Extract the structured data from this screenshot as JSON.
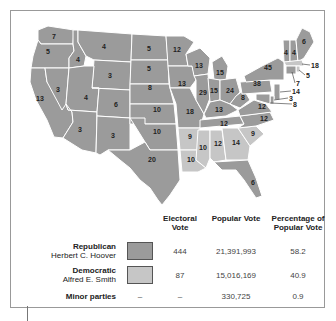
{
  "colors": {
    "republican": "#9b9b9b",
    "democratic": "#c6c6c6",
    "border": "#ffffff"
  },
  "states": [
    {
      "abbr": "WA",
      "ev": "7",
      "party": "R"
    },
    {
      "abbr": "OR",
      "ev": "5",
      "party": "R"
    },
    {
      "abbr": "CA",
      "ev": "13",
      "party": "R"
    },
    {
      "abbr": "NV",
      "ev": "3",
      "party": "R"
    },
    {
      "abbr": "ID",
      "ev": "4",
      "party": "R"
    },
    {
      "abbr": "MT",
      "ev": "4",
      "party": "R"
    },
    {
      "abbr": "WY",
      "ev": "3",
      "party": "R"
    },
    {
      "abbr": "UT",
      "ev": "4",
      "party": "R"
    },
    {
      "abbr": "AZ",
      "ev": "3",
      "party": "R"
    },
    {
      "abbr": "CO",
      "ev": "6",
      "party": "R"
    },
    {
      "abbr": "NM",
      "ev": "3",
      "party": "R"
    },
    {
      "abbr": "ND",
      "ev": "5",
      "party": "R"
    },
    {
      "abbr": "SD",
      "ev": "5",
      "party": "R"
    },
    {
      "abbr": "NE",
      "ev": "8",
      "party": "R"
    },
    {
      "abbr": "KS",
      "ev": "10",
      "party": "R"
    },
    {
      "abbr": "OK",
      "ev": "10",
      "party": "R"
    },
    {
      "abbr": "TX",
      "ev": "20",
      "party": "R"
    },
    {
      "abbr": "MN",
      "ev": "12",
      "party": "R"
    },
    {
      "abbr": "IA",
      "ev": "13",
      "party": "R"
    },
    {
      "abbr": "MO",
      "ev": "18",
      "party": "R"
    },
    {
      "abbr": "AR",
      "ev": "9",
      "party": "D"
    },
    {
      "abbr": "LA",
      "ev": "10",
      "party": "D"
    },
    {
      "abbr": "WI",
      "ev": "13",
      "party": "R"
    },
    {
      "abbr": "IL",
      "ev": "29",
      "party": "R"
    },
    {
      "abbr": "MI",
      "ev": "15",
      "party": "R"
    },
    {
      "abbr": "IN",
      "ev": "15",
      "party": "R"
    },
    {
      "abbr": "OH",
      "ev": "24",
      "party": "R"
    },
    {
      "abbr": "KY",
      "ev": "13",
      "party": "R"
    },
    {
      "abbr": "TN",
      "ev": "12",
      "party": "R"
    },
    {
      "abbr": "MS",
      "ev": "10",
      "party": "D"
    },
    {
      "abbr": "AL",
      "ev": "12",
      "party": "D"
    },
    {
      "abbr": "GA",
      "ev": "14",
      "party": "D"
    },
    {
      "abbr": "FL",
      "ev": "6",
      "party": "R"
    },
    {
      "abbr": "SC",
      "ev": "9",
      "party": "D"
    },
    {
      "abbr": "NC",
      "ev": "12",
      "party": "R"
    },
    {
      "abbr": "VA",
      "ev": "12",
      "party": "R"
    },
    {
      "abbr": "WV",
      "ev": "8",
      "party": "R"
    },
    {
      "abbr": "PA",
      "ev": "38",
      "party": "R"
    },
    {
      "abbr": "NY",
      "ev": "45",
      "party": "R"
    },
    {
      "abbr": "VT",
      "ev": "4",
      "party": "R"
    },
    {
      "abbr": "NH",
      "ev": "4",
      "party": "R"
    },
    {
      "abbr": "ME",
      "ev": "6",
      "party": "R"
    },
    {
      "abbr": "MA",
      "ev": "18",
      "party": "D"
    },
    {
      "abbr": "RI",
      "ev": "5",
      "party": "D"
    },
    {
      "abbr": "CT",
      "ev": "7",
      "party": "R"
    },
    {
      "abbr": "NJ",
      "ev": "14",
      "party": "R"
    },
    {
      "abbr": "DE",
      "ev": "3",
      "party": "R"
    },
    {
      "abbr": "MD",
      "ev": "8",
      "party": "R"
    }
  ],
  "table": {
    "headers": {
      "electoral": "Electoral Vote",
      "popular": "Popular Vote",
      "percentage": "Percentage of Popular Vote"
    },
    "rows": [
      {
        "party": "Republican",
        "candidate": "Herbert C. Hoover",
        "swatch": "republican",
        "electoral": "444",
        "popular": "21,391,993",
        "percentage": "58.2"
      },
      {
        "party": "Democratic",
        "candidate": "Alfred E. Smith",
        "swatch": "democratic",
        "electoral": "87",
        "popular": "15,016,169",
        "percentage": "40.9"
      },
      {
        "party": "Minor parties",
        "candidate": "",
        "swatch": "",
        "swatch_placeholder": "–",
        "electoral": "–",
        "popular": "330,725",
        "percentage": "0.9"
      }
    ]
  }
}
